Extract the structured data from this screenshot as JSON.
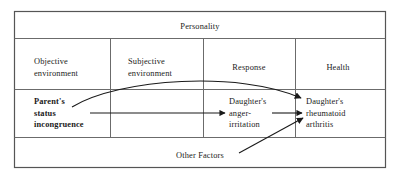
{
  "figure": {
    "title": "Personality",
    "columns": [
      {
        "id": "objective-environment",
        "label": "Objective\nenvironment"
      },
      {
        "id": "subjective-environment",
        "label": "Subjective\nenvironment"
      },
      {
        "id": "response",
        "label": "Response"
      },
      {
        "id": "health",
        "label": "Health"
      }
    ],
    "nodes": [
      {
        "id": "parents-status-incongruence",
        "label": "Parent's\nstatus\nincongruence",
        "column": "objective-environment",
        "emphasis": "bold"
      },
      {
        "id": "daughters-anger-irritation",
        "label": "Daughter's\nanger-\nirritation",
        "column": "response",
        "emphasis": "normal"
      },
      {
        "id": "daughters-rheumatoid-arthritis",
        "label": "Daughter's\nrheumatoid\narthritis",
        "column": "health",
        "emphasis": "normal"
      },
      {
        "id": "other-factors",
        "label": "Other Factors",
        "column": "bottom-band",
        "emphasis": "normal"
      }
    ],
    "edges": [
      {
        "id": "parent-to-arthritis-curved",
        "from": "parents-status-incongruence",
        "to": "daughters-rheumatoid-arthritis",
        "style": "curved",
        "arrow": "end"
      },
      {
        "id": "parent-to-anger-straight",
        "from": "parents-status-incongruence",
        "to": "daughters-anger-irritation",
        "style": "straight",
        "arrow": "end"
      },
      {
        "id": "anger-to-arthritis-straight",
        "from": "daughters-anger-irritation",
        "to": "daughters-rheumatoid-arthritis",
        "style": "straight",
        "arrow": "end"
      },
      {
        "id": "other-factors-to-arthritis-diagonal",
        "from": "other-factors",
        "to": "daughters-rheumatoid-arthritis",
        "style": "diagonal",
        "arrow": "end"
      }
    ],
    "colors": {
      "border": "#555555",
      "divider": "#6b6b6b",
      "arrow": "#1a1a1a",
      "text": "#1a1a1a",
      "background": "#ffffff"
    },
    "geometry": {
      "frame": {
        "x": 14,
        "y": 11,
        "width": 372,
        "height": 157
      },
      "row_dividers_y": [
        38,
        89,
        138
      ],
      "column_dividers_x": [
        110,
        203,
        295
      ]
    }
  }
}
